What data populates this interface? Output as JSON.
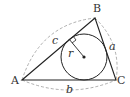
{
  "diagram": {
    "type": "triangle-incircle",
    "vertices": {
      "A": {
        "label": "A",
        "x": 22,
        "y": 80
      },
      "B": {
        "label": "B",
        "x": 95,
        "y": 18
      },
      "C": {
        "label": "C",
        "x": 116,
        "y": 80
      }
    },
    "sides": {
      "a": {
        "label": "a"
      },
      "b": {
        "label": "b"
      },
      "c": {
        "label": "c"
      }
    },
    "incircle": {
      "cx": 84,
      "cy": 57,
      "r": 23,
      "radius_label": "r"
    },
    "colors": {
      "line": "#222222",
      "dashed": "#999999",
      "text": "#333333"
    }
  }
}
